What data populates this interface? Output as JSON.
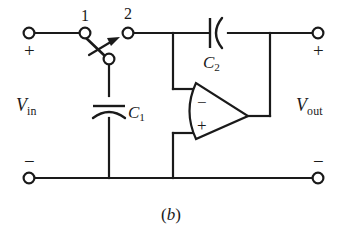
{
  "figure": {
    "caption_open": "(",
    "caption_letter": "b",
    "caption_close": ")",
    "caption_full": "(b)",
    "line_color": "#1a1a1a",
    "background_color": "#ffffff"
  },
  "nodes": {
    "node1_label": "1",
    "node2_label": "2"
  },
  "ports": {
    "input": {
      "name": "V",
      "subscript": "in",
      "full": "Vin",
      "plus_sign": "+",
      "minus_sign": "−"
    },
    "output": {
      "name": "V",
      "subscript": "out",
      "full": "Vout",
      "plus_sign": "+",
      "minus_sign": "−"
    }
  },
  "components": {
    "capacitor_1": {
      "name": "C",
      "subscript": "1",
      "full": "C1",
      "orientation": "vertical",
      "style": "curved-plate"
    },
    "capacitor_2": {
      "name": "C",
      "subscript": "2",
      "full": "C2",
      "orientation": "horizontal",
      "style": "curved-plate"
    },
    "opamp": {
      "inverting_sign": "−",
      "noninverting_sign": "+",
      "shape": "triangle-curved-back"
    },
    "switch": {
      "type": "spdt-throw-switch",
      "position_label_1": "1",
      "position_label_2": "2"
    }
  }
}
